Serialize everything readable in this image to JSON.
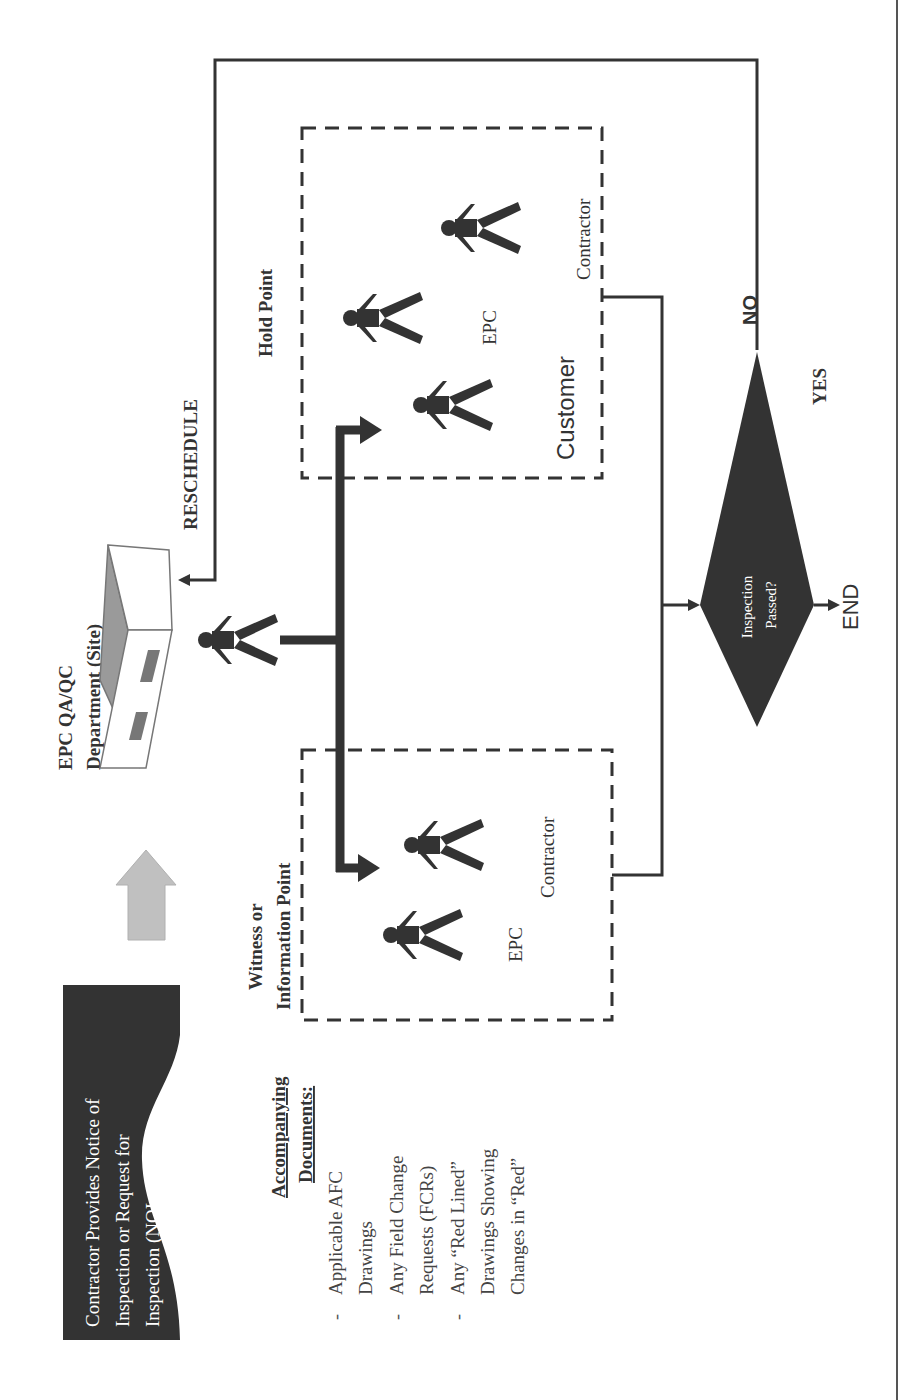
{
  "diagram": {
    "orientation": "rotated -90 degrees (landscape content in portrait page)",
    "start_box": {
      "lines": [
        "Contractor Provides Notice of",
        "Inspection or Request for",
        "Inspection (NOI or RFI)"
      ],
      "fill": "#333333",
      "text_color": "#ffffff"
    },
    "documents": {
      "heading_line1": "Accompanying",
      "heading_line2": "Documents:",
      "items": [
        {
          "bullet": "-",
          "lines": [
            "Applicable AFC",
            "Drawings"
          ]
        },
        {
          "bullet": "-",
          "lines": [
            "Any Field Change",
            "Requests (FCRs)"
          ]
        },
        {
          "bullet": "-",
          "lines": [
            "Any “Red Lined”",
            "Drawings Showing",
            "Changes in “Red”"
          ]
        }
      ]
    },
    "department": {
      "line1": "EPC QA/QC",
      "line2": "Department (Site)",
      "icon": "building-icon"
    },
    "reschedule_label": "RESCHEDULE",
    "witness_group": {
      "title_line1": "Witness or",
      "title_line2": "Information Point",
      "people": [
        {
          "label": "EPC",
          "icon": "person-icon"
        },
        {
          "label": "Contractor",
          "icon": "person-icon"
        }
      ]
    },
    "hold_group": {
      "title": "Hold Point",
      "people": [
        {
          "label": "Customer",
          "icon": "person-icon"
        },
        {
          "label": "EPC",
          "icon": "person-icon"
        },
        {
          "label": "Contractor",
          "icon": "person-icon"
        }
      ]
    },
    "decision": {
      "line1": "Inspection",
      "line2": "Passed?",
      "yes_label": "YES",
      "no_label": "NO",
      "end_label": "END",
      "fill": "#333333"
    },
    "colors": {
      "line": "#333333",
      "arrow_block": "#c0c0c0",
      "building_roof": "#9a9a9a",
      "building_window": "#777777"
    }
  }
}
